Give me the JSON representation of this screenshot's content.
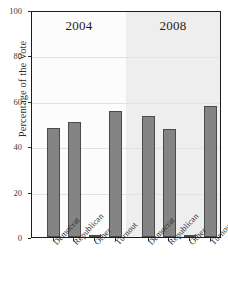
{
  "figure": {
    "clipped_top_title": "",
    "axis_frame_color": "#1c1c1c",
    "bar_fill_color": "#848484",
    "bar_edge_color": "#4a4a4a",
    "panel_2004_bg": "#fcfcfc",
    "panel_2008_bg": "#eeeeee",
    "gridline_color": "#e2e2e2"
  },
  "chart_data": {
    "type": "bar",
    "title": "",
    "xlabel": "",
    "ylabel": "Percentage of the Vote",
    "ylim": [
      0,
      100
    ],
    "yticks": [
      0,
      20,
      40,
      60,
      80,
      100
    ],
    "ytick_labels": [
      "0",
      "20",
      "40",
      "60",
      "80",
      "100"
    ],
    "grid": true,
    "legend": "none",
    "panels": [
      {
        "label": "2004",
        "categories": [
          "Democrat",
          "Republican",
          "Other",
          "Turnout"
        ],
        "values": [
          48,
          50.5,
          1,
          55.5
        ]
      },
      {
        "label": "2008",
        "categories": [
          "Democrat",
          "Republican",
          "Other",
          "Turnout"
        ],
        "values": [
          53.5,
          47.5,
          1,
          57.5
        ]
      }
    ]
  }
}
